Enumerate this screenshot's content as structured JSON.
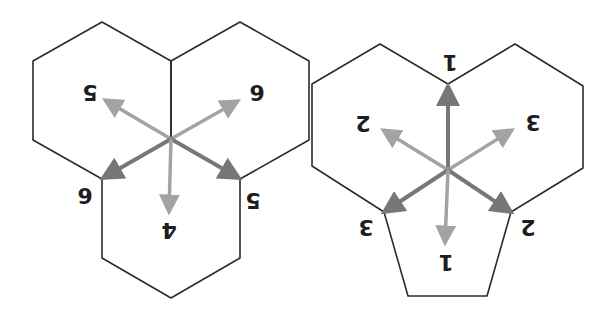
{
  "orientation": "rotated-180",
  "colors": {
    "background": "#ffffff",
    "edge": "#2b2b2b",
    "arrow_dark": "#777777",
    "arrow_light": "#a3a3a3",
    "label": "#1e1e1e"
  },
  "figures": [
    {
      "name": "three-hexagons-vertex",
      "center": [
        171,
        139
      ],
      "polygons": [
        {
          "shape": "hexagon",
          "points": "171,61 102,22 33,61 33,140 102,179 171,139"
        },
        {
          "shape": "hexagon",
          "points": "171,61 240,22 309,61 309,140 240,179 171,139"
        },
        {
          "shape": "hexagon",
          "points": "171,139 102,179 102,258 171,298 240,258 240,179"
        }
      ],
      "arrows": [
        {
          "to": [
            105,
            100
          ],
          "tone": "light",
          "label": "5",
          "label_pos": [
            90,
            92
          ]
        },
        {
          "to": [
            238,
            101
          ],
          "tone": "light",
          "label": "6",
          "label_pos": [
            257,
            92
          ]
        },
        {
          "to": [
            103,
            178
          ],
          "tone": "dark",
          "label": "6",
          "label_pos": [
            85,
            195
          ]
        },
        {
          "to": [
            239,
            178
          ],
          "tone": "dark",
          "label": "5",
          "label_pos": [
            253,
            200
          ]
        },
        {
          "to": [
            169,
            212
          ],
          "tone": "light",
          "label": "4",
          "label_pos": [
            169,
            230
          ]
        }
      ]
    },
    {
      "name": "two-hexagons-pentagon-vertex",
      "center": [
        448,
        170
      ],
      "polygons": [
        {
          "shape": "hexagon",
          "points": "448,84 380,44 312,84 312,166 384,212 448,170"
        },
        {
          "shape": "hexagon",
          "points": "448,84 515,44 583,86 583,168 511,212 448,170"
        },
        {
          "shape": "pentagon",
          "points": "448,170 511,212 487,296 408,296 384,212"
        }
      ],
      "arrows": [
        {
          "to": [
            448,
            86
          ],
          "tone": "dark",
          "label": "1",
          "label_pos": [
            450,
            62
          ]
        },
        {
          "to": [
            383,
            130
          ],
          "tone": "light",
          "label": "2",
          "label_pos": [
            363,
            123
          ]
        },
        {
          "to": [
            512,
            130
          ],
          "tone": "light",
          "label": "3",
          "label_pos": [
            533,
            122
          ]
        },
        {
          "to": [
            384,
            212
          ],
          "tone": "dark",
          "label": "3",
          "label_pos": [
            366,
            227
          ]
        },
        {
          "to": [
            511,
            212
          ],
          "tone": "dark",
          "label": "2",
          "label_pos": [
            528,
            227
          ]
        },
        {
          "to": [
            445,
            243
          ],
          "tone": "light",
          "label": "1",
          "label_pos": [
            446,
            262
          ]
        }
      ]
    }
  ]
}
